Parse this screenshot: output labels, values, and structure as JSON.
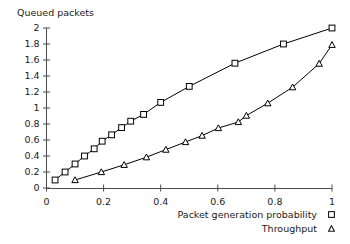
{
  "chart_data": {
    "type": "line",
    "title": "",
    "xlabel": "",
    "ylabel": "Queued packets",
    "xlim": [
      0,
      1
    ],
    "ylim": [
      0,
      2
    ],
    "grid": false,
    "legend_position": "below-right",
    "x_ticks": [
      "0",
      "0.2",
      "0.4",
      "0.6",
      "0.8",
      "1"
    ],
    "x_tick_values": [
      0,
      0.2,
      0.4,
      0.6,
      0.8,
      1
    ],
    "y_ticks": [
      "0",
      "0.2",
      "0.4",
      "0.6",
      "0.8",
      "1",
      "1.2",
      "1.4",
      "1.6",
      "1.8",
      "2"
    ],
    "y_tick_values": [
      0,
      0.2,
      0.4,
      0.6,
      0.8,
      1,
      1.2,
      1.4,
      1.6,
      1.8,
      2
    ],
    "series": [
      {
        "name": "Packet generation probability",
        "marker": "square",
        "color": "#000000",
        "points": [
          [
            0.03,
            0.1
          ],
          [
            0.065,
            0.2
          ],
          [
            0.1,
            0.3
          ],
          [
            0.133,
            0.4
          ],
          [
            0.167,
            0.49
          ],
          [
            0.195,
            0.585
          ],
          [
            0.228,
            0.665
          ],
          [
            0.263,
            0.755
          ],
          [
            0.295,
            0.835
          ],
          [
            0.34,
            0.92
          ],
          [
            0.4,
            1.07
          ],
          [
            0.5,
            1.27
          ],
          [
            0.66,
            1.56
          ],
          [
            0.83,
            1.8
          ],
          [
            1.0,
            2.0
          ]
        ]
      },
      {
        "name": "Throughput",
        "marker": "triangle",
        "color": "#000000",
        "points": [
          [
            0.1,
            0.1
          ],
          [
            0.192,
            0.2
          ],
          [
            0.272,
            0.29
          ],
          [
            0.35,
            0.385
          ],
          [
            0.418,
            0.48
          ],
          [
            0.487,
            0.575
          ],
          [
            0.545,
            0.655
          ],
          [
            0.602,
            0.75
          ],
          [
            0.672,
            0.825
          ],
          [
            0.7,
            0.905
          ],
          [
            0.775,
            1.06
          ],
          [
            0.862,
            1.26
          ],
          [
            0.955,
            1.555
          ],
          [
            1.0,
            1.79
          ]
        ]
      }
    ]
  },
  "legend": {
    "entries": [
      {
        "label": "Packet generation probability",
        "marker": "square-marker"
      },
      {
        "label": "Throughput",
        "marker": "triangle-marker"
      }
    ]
  }
}
